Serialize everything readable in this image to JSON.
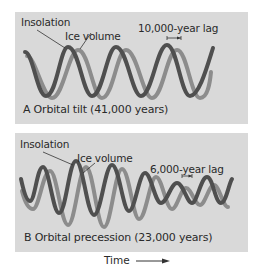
{
  "panels": [
    {
      "id": "A",
      "labels": {
        "insolation": "Insolation",
        "ice_volume": "Ice volume",
        "lag": "10,000-year lag",
        "caption": "A  Orbital tilt (41,000 years)"
      }
    },
    {
      "id": "B",
      "labels": {
        "insolation": "Insolation",
        "ice_volume": "Ice volume",
        "lag": "6,000-year lag",
        "caption": "B  Orbital precession (23,000 years)"
      }
    }
  ],
  "axis": {
    "x_label": "Time"
  },
  "colors": {
    "panel_bg": "#d9d9d9",
    "insolation": "#4f4f4f",
    "ice_volume": "#8c8c8c"
  }
}
